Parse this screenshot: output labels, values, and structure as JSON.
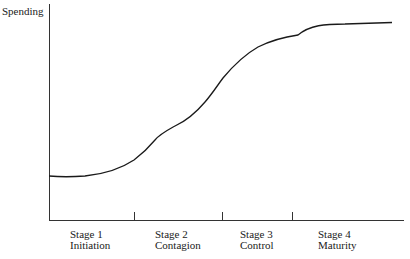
{
  "diagram": {
    "y_axis_label": "Spending",
    "stages": [
      {
        "number": "Stage 1",
        "name": "Initiation"
      },
      {
        "number": "Stage 2",
        "name": "Contagion"
      },
      {
        "number": "Stage 3",
        "name": "Control"
      },
      {
        "number": "Stage 4",
        "name": "Maturity"
      }
    ],
    "curve_description": "S-shaped growth curve of spending across four stages; flat during Initiation, rising steeply through Contagion and Control, leveling off in Maturity",
    "line_color": "#1a1a1a"
  }
}
